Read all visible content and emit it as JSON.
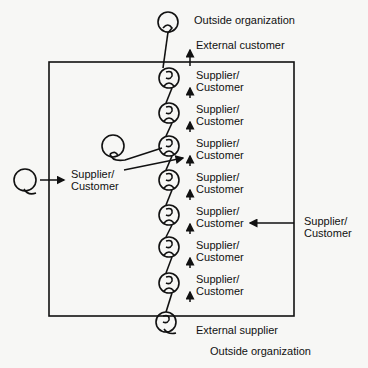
{
  "diagram": {
    "top": {
      "outside_label": "Outside organization",
      "external_label": "External customer"
    },
    "bottom": {
      "external_label": "External supplier",
      "outside_label": "Outside organization"
    },
    "chain_labels": [
      {
        "line1": "Supplier/",
        "line2": "Customer"
      },
      {
        "line1": "Supplier/",
        "line2": "Customer"
      },
      {
        "line1": "Supplier/",
        "line2": "Customer"
      },
      {
        "line1": "Supplier/",
        "line2": "Customer"
      },
      {
        "line1": "Supplier/",
        "line2": "Customer"
      },
      {
        "line1": "Supplier/",
        "line2": "Customer"
      },
      {
        "line1": "Supplier/",
        "line2": "Customer"
      }
    ],
    "left_external": {
      "line1": "Supplier/",
      "line2": "Customer"
    },
    "right_external": {
      "line1": "Supplier/",
      "line2": "Customer"
    },
    "colors": {
      "ink": "#111111",
      "background": "#f7f7f5"
    }
  }
}
